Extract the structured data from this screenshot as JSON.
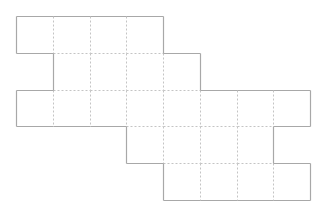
{
  "diagram": {
    "type": "grid-polyomino-net",
    "origin": [
      16,
      16
    ],
    "cell_size": 36.75,
    "rows": [
      {
        "row": 0,
        "start_col": 0,
        "end_col": 3
      },
      {
        "row": 1,
        "start_col": 1,
        "end_col": 4
      },
      {
        "row": 2,
        "start_col": 0,
        "end_col": 7
      },
      {
        "row": 3,
        "start_col": 3,
        "end_col": 6
      },
      {
        "row": 4,
        "start_col": 4,
        "end_col": 7
      }
    ],
    "colors": {
      "outline": "#a8a8a8",
      "inner_dashed": "#c4c4c4",
      "fill": "#ffffff"
    },
    "total_cells": 28
  }
}
